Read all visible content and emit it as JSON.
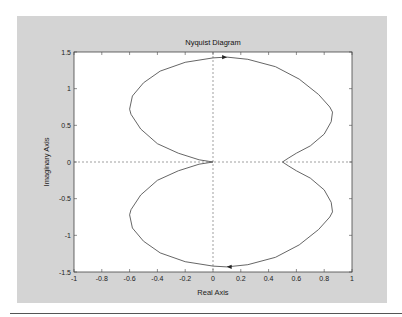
{
  "chart_data": {
    "type": "line",
    "title": "Nyquist Diagram",
    "xlabel": "Real Axis",
    "ylabel": "Imaginary Axis",
    "xlim": [
      -1,
      1
    ],
    "ylim": [
      -1.5,
      1.5
    ],
    "xticks": [
      -1,
      -0.8,
      -0.6,
      -0.4,
      -0.2,
      0,
      0.2,
      0.4,
      0.6,
      0.8,
      1
    ],
    "xtick_labels": [
      "-1",
      "-0.8",
      "-0.6",
      "-0.4",
      "-0.2",
      "0",
      "0.2",
      "0.4",
      "0.6",
      "0.8",
      "1"
    ],
    "yticks": [
      -1.5,
      -1,
      -0.5,
      0,
      0.5,
      1,
      1.5
    ],
    "ytick_labels": [
      "-1.5",
      "-1",
      "-0.5",
      "0",
      "0.5",
      "1",
      "1.5"
    ],
    "grid": false,
    "reference_lines": [
      "dashed horizontal at imag=0",
      "dashed vertical at real=0"
    ],
    "series": [
      {
        "name": "Nyquist curve (upper half, positive frequencies)",
        "points": [
          [
            0,
            0
          ],
          [
            -0.1,
            0.03
          ],
          [
            -0.25,
            0.12
          ],
          [
            -0.4,
            0.25
          ],
          [
            -0.52,
            0.45
          ],
          [
            -0.59,
            0.65
          ],
          [
            -0.6,
            0.72
          ],
          [
            -0.58,
            0.9
          ],
          [
            -0.5,
            1.08
          ],
          [
            -0.38,
            1.24
          ],
          [
            -0.2,
            1.36
          ],
          [
            0,
            1.42
          ],
          [
            0.1,
            1.43
          ],
          [
            0.25,
            1.4
          ],
          [
            0.45,
            1.3
          ],
          [
            0.62,
            1.13
          ],
          [
            0.76,
            0.92
          ],
          [
            0.84,
            0.75
          ],
          [
            0.86,
            0.68
          ],
          [
            0.85,
            0.55
          ],
          [
            0.8,
            0.38
          ],
          [
            0.7,
            0.22
          ],
          [
            0.6,
            0.12
          ],
          [
            0.54,
            0.05
          ],
          [
            0.5,
            0
          ]
        ],
        "mirror_about_real_axis": true
      }
    ],
    "direction_arrows": [
      {
        "at": [
          0.08,
          1.43
        ],
        "direction": "right"
      },
      {
        "at": [
          0.12,
          -1.43
        ],
        "direction": "left"
      }
    ]
  },
  "colors": {
    "figure_background": "#d4d4d4",
    "axes_background": "#ffffff",
    "curve": "#555555",
    "axes_frame": "#444444"
  }
}
